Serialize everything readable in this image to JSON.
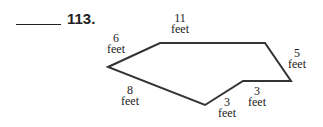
{
  "problem": {
    "number": "113."
  },
  "shape": {
    "type": "hexagon",
    "stroke_color": "#333333",
    "vertices": [
      [
        108,
        67
      ],
      [
        160,
        43
      ],
      [
        265,
        43
      ],
      [
        291,
        81
      ],
      [
        243,
        81
      ],
      [
        205,
        105
      ]
    ]
  },
  "labels": {
    "top": {
      "value": "11",
      "unit": "feet"
    },
    "upper_left": {
      "value": "6",
      "unit": "feet"
    },
    "right": {
      "value": "5",
      "unit": "feet"
    },
    "lower_right": {
      "value": "3",
      "unit": "feet"
    },
    "bottom_notch": {
      "value": "3",
      "unit": "feet"
    },
    "lower_left": {
      "value": "8",
      "unit": "feet"
    }
  }
}
